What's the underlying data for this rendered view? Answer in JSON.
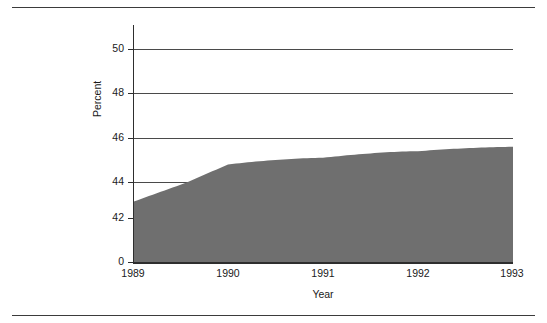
{
  "figure": {
    "top_rule": "horizontal-rule",
    "bottom_rule": "horizontal-rule"
  },
  "chart_data": {
    "type": "area",
    "title": "",
    "subtitle": "",
    "xlabel": "Year",
    "ylabel": "Percent",
    "x": [
      1989,
      1990,
      1991,
      1992,
      1993
    ],
    "categories": [
      "1989",
      "1990",
      "1991",
      "1992",
      "1993"
    ],
    "values": [
      42.9,
      44.8,
      45.1,
      45.4,
      45.6
    ],
    "series": [
      {
        "name": "Percent",
        "values": [
          42.9,
          44.8,
          45.1,
          45.4,
          45.6
        ]
      }
    ],
    "xlim": [
      1989,
      1993
    ],
    "ylim": [
      0,
      51.2
    ],
    "y_axis_break": true,
    "y_break_note": "axis jumps from 0 to 42",
    "ytick_labels": [
      "50",
      "48",
      "46",
      "44",
      "42",
      "0"
    ],
    "ytick_values": [
      50,
      48,
      46,
      44,
      42,
      0
    ],
    "xtick_labels": [
      "1989",
      "1990",
      "1991",
      "1992",
      "1993"
    ],
    "gridlines": [
      50,
      48,
      46,
      44
    ],
    "grid": true,
    "legend": false,
    "legend_position": "none",
    "colors": {
      "area_fill": "#6f6f6f",
      "axis": "#2e2e2e",
      "grid": "#4a4a4a",
      "text": "#1a1a1a",
      "background": "#ffffff",
      "rule": "#3b3b3b"
    }
  }
}
